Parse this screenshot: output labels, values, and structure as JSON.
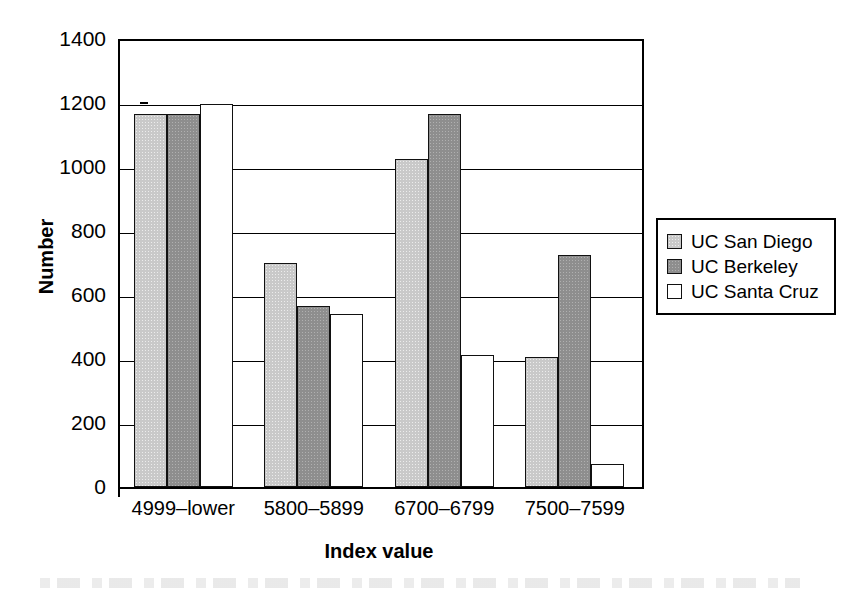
{
  "chart_data": {
    "type": "bar",
    "title": "",
    "xlabel": "Index value",
    "ylabel": "Number",
    "categories": [
      "4999–lower",
      "5800–5899",
      "6700–6799",
      "7500–7599"
    ],
    "series": [
      {
        "name": "UC San Diego",
        "color": "#c9c9c9",
        "values": [
          1165,
          700,
          1025,
          405
        ]
      },
      {
        "name": "UC Berkeley",
        "color": "#8e8e8e",
        "values": [
          1165,
          565,
          1165,
          725
        ]
      },
      {
        "name": "UC Santa Cruz",
        "color": "#ffffff",
        "values": [
          1197,
          540,
          412,
          73
        ]
      }
    ],
    "ylim": [
      0,
      1400
    ],
    "yticks": [
      0,
      200,
      400,
      600,
      800,
      1000,
      1200,
      1400
    ],
    "ytick_labels": [
      "0",
      "200",
      "400",
      "600",
      "800",
      "1000",
      "1200",
      "1400"
    ],
    "grid": "horizontal",
    "legend_position": "right",
    "legend_entries": [
      "UC San Diego",
      "UC Berkeley",
      "UC Santa Cruz"
    ]
  }
}
